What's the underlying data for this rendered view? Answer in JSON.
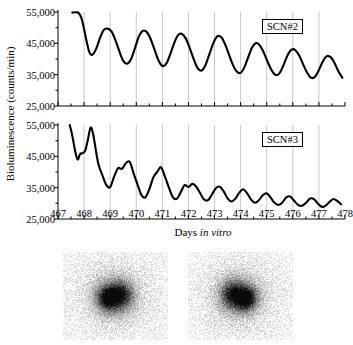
{
  "figure": {
    "axis_titles": {
      "y": "Bioluminescence (counts/min)",
      "x_prefix": "Days ",
      "x_italic": "in vitro"
    }
  },
  "chart_data": [
    {
      "type": "line",
      "title": "SCN#2",
      "panel": "top",
      "xlabel": "Days in vitro",
      "ylabel": "Bioluminescence (counts/min)",
      "xlim": [
        467,
        478
      ],
      "ylim": [
        25000,
        55000
      ],
      "xticks": [
        467,
        468,
        469,
        470,
        471,
        472,
        473,
        474,
        475,
        476,
        477,
        478
      ],
      "ytick_labels": [
        "25,000",
        "35,000",
        "45,000",
        "55,000"
      ],
      "yticks": [
        25000,
        35000,
        45000,
        55000
      ],
      "grid": "vertical-at-integer-days",
      "legend": "none",
      "series": [
        {
          "name": "SCN#2",
          "x": [
            467.55,
            467.7,
            467.8,
            467.9,
            468.0,
            468.1,
            468.2,
            468.3,
            468.45,
            468.6,
            468.75,
            468.9,
            469.05,
            469.2,
            469.35,
            469.5,
            469.65,
            469.8,
            469.95,
            470.1,
            470.25,
            470.4,
            470.55,
            470.7,
            470.85,
            471.0,
            471.15,
            471.3,
            471.45,
            471.6,
            471.75,
            471.9,
            472.05,
            472.2,
            472.35,
            472.5,
            472.65,
            472.8,
            472.95,
            473.1,
            473.25,
            473.4,
            473.55,
            473.7,
            473.85,
            474.0,
            474.15,
            474.3,
            474.45,
            474.6,
            474.75,
            474.9,
            475.05,
            475.2,
            475.35,
            475.5,
            475.65,
            475.8,
            475.95,
            476.1,
            476.25,
            476.4,
            476.55,
            476.7,
            476.85,
            477.0,
            477.15,
            477.3,
            477.45,
            477.6,
            477.75,
            477.9
          ],
          "y": [
            54800,
            54900,
            54600,
            53000,
            49500,
            45500,
            42200,
            41300,
            43000,
            46500,
            49200,
            49700,
            48800,
            46000,
            42500,
            39400,
            38500,
            40000,
            43500,
            47200,
            49000,
            48600,
            46400,
            43000,
            39600,
            37800,
            38500,
            41500,
            45000,
            47600,
            48000,
            46500,
            43500,
            40000,
            37100,
            36300,
            38000,
            41500,
            45000,
            47200,
            47000,
            44800,
            41500,
            38200,
            36000,
            35600,
            37500,
            40800,
            43800,
            45100,
            44200,
            41800,
            38800,
            36200,
            34900,
            35600,
            38200,
            41200,
            43000,
            42800,
            41000,
            38200,
            35600,
            34000,
            34300,
            36500,
            39200,
            40900,
            40600,
            38700,
            36000,
            34000
          ]
        }
      ]
    },
    {
      "type": "line",
      "title": "SCN#3",
      "panel": "bottom",
      "xlabel": "Days in vitro",
      "ylabel": "Bioluminescence (counts/min)",
      "xlim": [
        467,
        478
      ],
      "ylim": [
        25000,
        55000
      ],
      "xticks": [
        467,
        468,
        469,
        470,
        471,
        472,
        473,
        474,
        475,
        476,
        477,
        478
      ],
      "ytick_labels": [
        "25,000",
        "35,000",
        "45,000",
        "55,000"
      ],
      "yticks": [
        25000,
        35000,
        45000,
        55000
      ],
      "grid": "vertical-at-integer-days",
      "legend": "none",
      "series": [
        {
          "name": "SCN#3",
          "x": [
            467.45,
            467.55,
            467.65,
            467.75,
            467.85,
            467.95,
            468.05,
            468.15,
            468.25,
            468.35,
            468.45,
            468.55,
            468.7,
            468.85,
            469.0,
            469.15,
            469.3,
            469.45,
            469.6,
            469.75,
            469.9,
            470.05,
            470.2,
            470.35,
            470.5,
            470.65,
            470.8,
            470.95,
            471.1,
            471.25,
            471.4,
            471.55,
            471.7,
            471.85,
            472.0,
            472.15,
            472.3,
            472.45,
            472.6,
            472.75,
            472.9,
            473.05,
            473.2,
            473.35,
            473.5,
            473.65,
            473.8,
            473.95,
            474.1,
            474.25,
            474.4,
            474.55,
            474.7,
            474.85,
            475.0,
            475.15,
            475.3,
            475.45,
            475.6,
            475.75,
            475.9,
            476.05,
            476.2,
            476.35,
            476.5,
            476.65,
            476.8,
            476.95,
            477.1,
            477.25,
            477.4,
            477.55,
            477.7,
            477.85
          ],
          "y": [
            55000,
            51500,
            47000,
            44000,
            45800,
            46000,
            47000,
            50500,
            54200,
            52000,
            47000,
            42500,
            39000,
            35900,
            35200,
            38500,
            41200,
            41000,
            42800,
            43200,
            39500,
            36000,
            32600,
            31900,
            34500,
            38200,
            40000,
            41500,
            38500,
            35000,
            32000,
            31400,
            33500,
            35800,
            35200,
            36200,
            35300,
            33200,
            31200,
            31000,
            32800,
            34800,
            35300,
            33800,
            31600,
            30600,
            31500,
            33400,
            34500,
            33200,
            31200,
            30200,
            31000,
            32600,
            33200,
            31800,
            30200,
            29500,
            30300,
            31900,
            32200,
            30800,
            29500,
            29200,
            30100,
            31500,
            31400,
            30000,
            28900,
            29200,
            30400,
            31400,
            30800,
            29700
          ]
        }
      ]
    }
  ],
  "panel_tags": {
    "top": "SCN#2",
    "bottom": "SCN#3"
  },
  "images": {
    "left": "bioluminescence-image-scn2",
    "right": "bioluminescence-image-scn3"
  }
}
